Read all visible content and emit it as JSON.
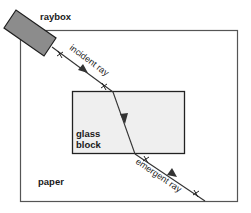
{
  "labels": {
    "raybox": "raybox",
    "incident_ray": "incident ray",
    "glass_line1": "glass",
    "glass_line2": "block",
    "emergent_ray": "emergent ray",
    "paper": "paper"
  },
  "colors": {
    "raybox_fill": "#8c8c8c",
    "glass_fill": "#efefef",
    "line": "#333333",
    "paper_border": "#555555"
  }
}
